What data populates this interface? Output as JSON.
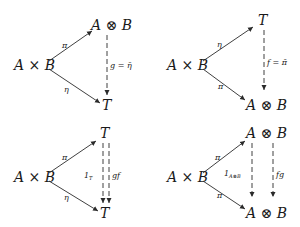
{
  "diagrams": [
    {
      "id": "top-left",
      "source": "A × B",
      "top": "A ⊗ B",
      "bottom": "T",
      "upper_arrow_label": "π",
      "lower_arrow_label": "η",
      "vertical_label": "g = η̄"
    },
    {
      "id": "top-right",
      "source": "A × B",
      "top": "T",
      "bottom": "A ⊗ B",
      "upper_arrow_label": "η",
      "lower_arrow_label": "π",
      "vertical_label": "f = π̄"
    },
    {
      "id": "bottom-left",
      "source": "A × B",
      "top": "T",
      "bottom": "T",
      "upper_arrow_label": "π",
      "lower_arrow_label": "η",
      "vertical_left_label": "1",
      "vertical_left_subscript": "T",
      "vertical_right_label": "gf"
    },
    {
      "id": "bottom-right",
      "source": "A × B",
      "top": "A ⊗ B",
      "bottom": "A ⊗ B",
      "upper_arrow_label": "π",
      "lower_arrow_label": "π",
      "vertical_left_label": "1",
      "vertical_left_subscript": "A⊗B",
      "vertical_right_label": "fg"
    }
  ]
}
